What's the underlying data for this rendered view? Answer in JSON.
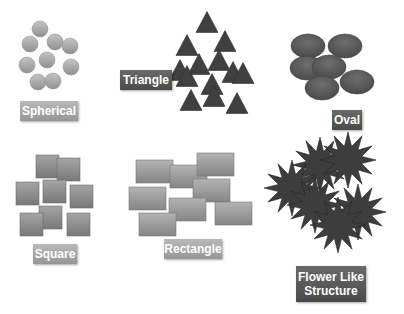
{
  "groups": {
    "spherical": {
      "label": "Spherical",
      "color": "#a6a6a6",
      "circles": [
        [
          40,
          29
        ],
        [
          30,
          44
        ],
        [
          55,
          42
        ],
        [
          70,
          46
        ],
        [
          27,
          65
        ],
        [
          47,
          60
        ],
        [
          71,
          67
        ],
        [
          38,
          82
        ],
        [
          53,
          81
        ]
      ],
      "r": 8
    },
    "triangle": {
      "label": "Triangle",
      "color": "#404040",
      "triangles": [
        [
          207,
          22
        ],
        [
          187,
          45
        ],
        [
          225,
          41
        ],
        [
          180,
          70
        ],
        [
          199,
          64
        ],
        [
          219,
          60
        ],
        [
          187,
          76
        ],
        [
          233,
          72
        ],
        [
          212,
          84
        ],
        [
          243,
          73
        ],
        [
          191,
          100
        ],
        [
          214,
          96
        ],
        [
          237,
          103
        ]
      ],
      "size": 22
    },
    "oval": {
      "label": "Oval",
      "color": "#595959",
      "ovals": [
        [
          308,
          46
        ],
        [
          345,
          46
        ],
        [
          307,
          68
        ],
        [
          329,
          67
        ],
        [
          322,
          88
        ],
        [
          357,
          82
        ]
      ],
      "rx": 17,
      "ry": 12
    },
    "square": {
      "label": "Square",
      "color": "#8c8c8c",
      "squares": [
        [
          36,
          155
        ],
        [
          57,
          158
        ],
        [
          16,
          182
        ],
        [
          43,
          180
        ],
        [
          70,
          185
        ],
        [
          39,
          206
        ],
        [
          20,
          213
        ],
        [
          67,
          213
        ]
      ],
      "size": 23
    },
    "rectangle": {
      "label": "Rectangle",
      "color": "#999999",
      "rects": [
        [
          136,
          160
        ],
        [
          170,
          165
        ],
        [
          197,
          153
        ],
        [
          129,
          187
        ],
        [
          193,
          179
        ],
        [
          169,
          198
        ],
        [
          215,
          202
        ],
        [
          139,
          213
        ]
      ],
      "w": 37,
      "h": 23
    },
    "flower": {
      "label_line1": "Flower Like",
      "label_line2": "Structure",
      "color": "#3d3d3d",
      "stars": [
        [
          320,
          165
        ],
        [
          348,
          160
        ],
        [
          292,
          188
        ],
        [
          315,
          205
        ],
        [
          358,
          212
        ],
        [
          338,
          225
        ]
      ],
      "outer": 28,
      "inner": 14,
      "points": 12
    }
  }
}
